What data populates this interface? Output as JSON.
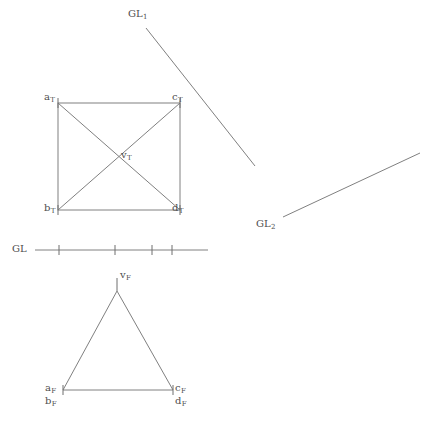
{
  "canvas": {
    "width": 436,
    "height": 432,
    "background": "#ffffff",
    "stroke_color": "#808080",
    "text_color": "#4d4d4d",
    "stroke_width": 1
  },
  "figure": {
    "title_visible": false
  },
  "ground_lines": [
    {
      "name": "GL_1",
      "label": "GL",
      "subscript": "1",
      "label_x": 128,
      "label_y": 9,
      "x1": 146,
      "y1": 28,
      "x2": 255,
      "y2": 166
    },
    {
      "name": "GL_2",
      "label": "GL",
      "subscript": "2",
      "label_x": 256,
      "label_y": 219,
      "x1": 283,
      "y1": 217,
      "x2": 420,
      "y2": 153
    },
    {
      "name": "GL",
      "label": "GL",
      "subscript": "",
      "label_x": 12,
      "label_y": 244,
      "x1": 35,
      "y1": 250,
      "x2": 208,
      "y2": 250,
      "ticks": [
        59,
        115,
        152,
        172
      ],
      "tick_half_height": 5
    }
  ],
  "square": {
    "name": "top-view-square",
    "left": 58,
    "top": 103,
    "right": 180,
    "bottom": 210,
    "diagonals": true,
    "center_x": 119,
    "center_y": 156,
    "vertices": [
      {
        "id": "a_T",
        "letter": "a",
        "subscript": "T",
        "x": 58,
        "y": 103,
        "label_x": 44,
        "label_y": 92
      },
      {
        "id": "c_T",
        "letter": "c",
        "subscript": "T",
        "x": 180,
        "y": 103,
        "label_x": 172,
        "label_y": 92
      },
      {
        "id": "b_T",
        "letter": "b",
        "subscript": "T",
        "x": 58,
        "y": 210,
        "label_x": 44,
        "label_y": 203
      },
      {
        "id": "d_T",
        "letter": "d",
        "subscript": "T",
        "x": 180,
        "y": 210,
        "label_x": 172,
        "label_y": 203
      }
    ],
    "center_label": {
      "id": "v_T",
      "letter": "v",
      "subscript": "T",
      "label_x": 121,
      "label_y": 150
    },
    "corner_tick_half": 5
  },
  "triangle": {
    "name": "front-view-triangle",
    "apex": {
      "x": 117,
      "y": 291
    },
    "base_left": {
      "x": 63,
      "y": 390
    },
    "base_right": {
      "x": 173,
      "y": 390
    },
    "apex_tick": {
      "x": 117,
      "y": 278
    },
    "corner_tick_half": 5,
    "labels": [
      {
        "id": "v_F",
        "letter": "v",
        "subscript": "F",
        "label_x": 120,
        "label_y": 270
      },
      {
        "id": "a_F",
        "letter": "a",
        "subscript": "F",
        "label_x": 45,
        "label_y": 383
      },
      {
        "id": "b_F",
        "letter": "b",
        "subscript": "F",
        "label_x": 45,
        "label_y": 396
      },
      {
        "id": "c_F",
        "letter": "c",
        "subscript": "F",
        "label_x": 175,
        "label_y": 383
      },
      {
        "id": "d_F",
        "letter": "d",
        "subscript": "F",
        "label_x": 175,
        "label_y": 396
      }
    ]
  }
}
